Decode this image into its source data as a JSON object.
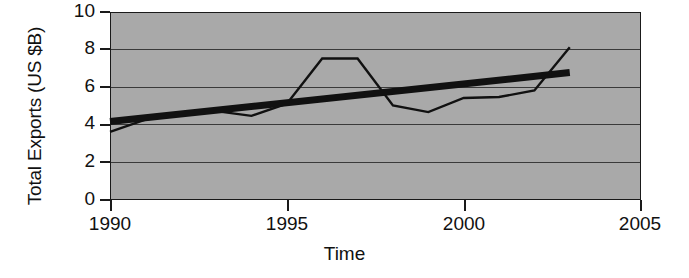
{
  "chart_data": {
    "type": "line",
    "title": "",
    "xlabel": "Time",
    "ylabel": "Total Exports (US $B)",
    "xlim": [
      1990,
      2005
    ],
    "ylim": [
      0,
      10
    ],
    "xticks": [
      1990,
      1995,
      2000,
      2005
    ],
    "xtick_labels": [
      "1990",
      "1995",
      "2000",
      "2005"
    ],
    "yticks": [
      0,
      2,
      4,
      6,
      8,
      10
    ],
    "ytick_labels": [
      "0",
      "2",
      "4",
      "6",
      "8",
      "10"
    ],
    "grid": "horizontal",
    "legend": "none",
    "plot_background": "#a9a9a9",
    "series": [
      {
        "name": "Total Exports",
        "style": "thin-line",
        "color": "#111111",
        "x": [
          1990,
          1991,
          1992,
          1993,
          1994,
          1995,
          1996,
          1997,
          1998,
          1999,
          2000,
          2001,
          2002,
          2003
        ],
        "values": [
          3.6,
          4.25,
          4.55,
          4.7,
          4.45,
          5.1,
          7.5,
          7.5,
          5.0,
          4.65,
          5.4,
          5.45,
          5.8,
          8.1
        ]
      },
      {
        "name": "Linear trend",
        "style": "thick-line",
        "color": "#111111",
        "x": [
          1990,
          2003
        ],
        "values": [
          4.15,
          6.75
        ]
      }
    ]
  },
  "axis": {
    "y_title": "Total Exports (US $B)",
    "x_title": "Time"
  }
}
